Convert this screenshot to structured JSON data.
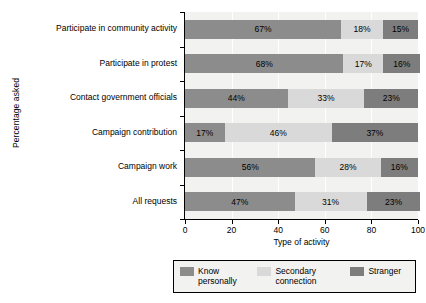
{
  "chart_data": {
    "type": "bar",
    "orientation": "horizontal",
    "stacked": true,
    "normalized_percent": true,
    "title": "",
    "xlabel": "Type of activity",
    "ylabel": "Percentage asked",
    "xlim": [
      0,
      100
    ],
    "xticks": [
      0,
      20,
      40,
      60,
      80,
      100
    ],
    "grid": true,
    "grid_axis": "x",
    "legend_position": "bottom",
    "categories": [
      "Participate in community activity",
      "Participate in protest",
      "Contact government officials",
      "Campaign contribution",
      "Campaign work",
      "All requests"
    ],
    "series": [
      {
        "name": "Know personally",
        "color": "#8c8c8c",
        "values": [
          67,
          68,
          44,
          17,
          56,
          47
        ],
        "labels": [
          "67%",
          "68%",
          "44%",
          "17%",
          "56%",
          "47%"
        ]
      },
      {
        "name": "Secondary connection",
        "color": "#d9d9d9",
        "values": [
          18,
          17,
          33,
          46,
          28,
          31
        ],
        "labels": [
          "18%",
          "17%",
          "33%",
          "46%",
          "28%",
          "31%"
        ]
      },
      {
        "name": "Stranger",
        "color": "#7d7d7d",
        "values": [
          15,
          16,
          23,
          37,
          16,
          23
        ],
        "labels": [
          "15%",
          "16%",
          "23%",
          "37%",
          "16%",
          "23%"
        ]
      }
    ],
    "xticklabels": [
      "0",
      "20",
      "40",
      "60",
      "80",
      "100"
    ]
  }
}
